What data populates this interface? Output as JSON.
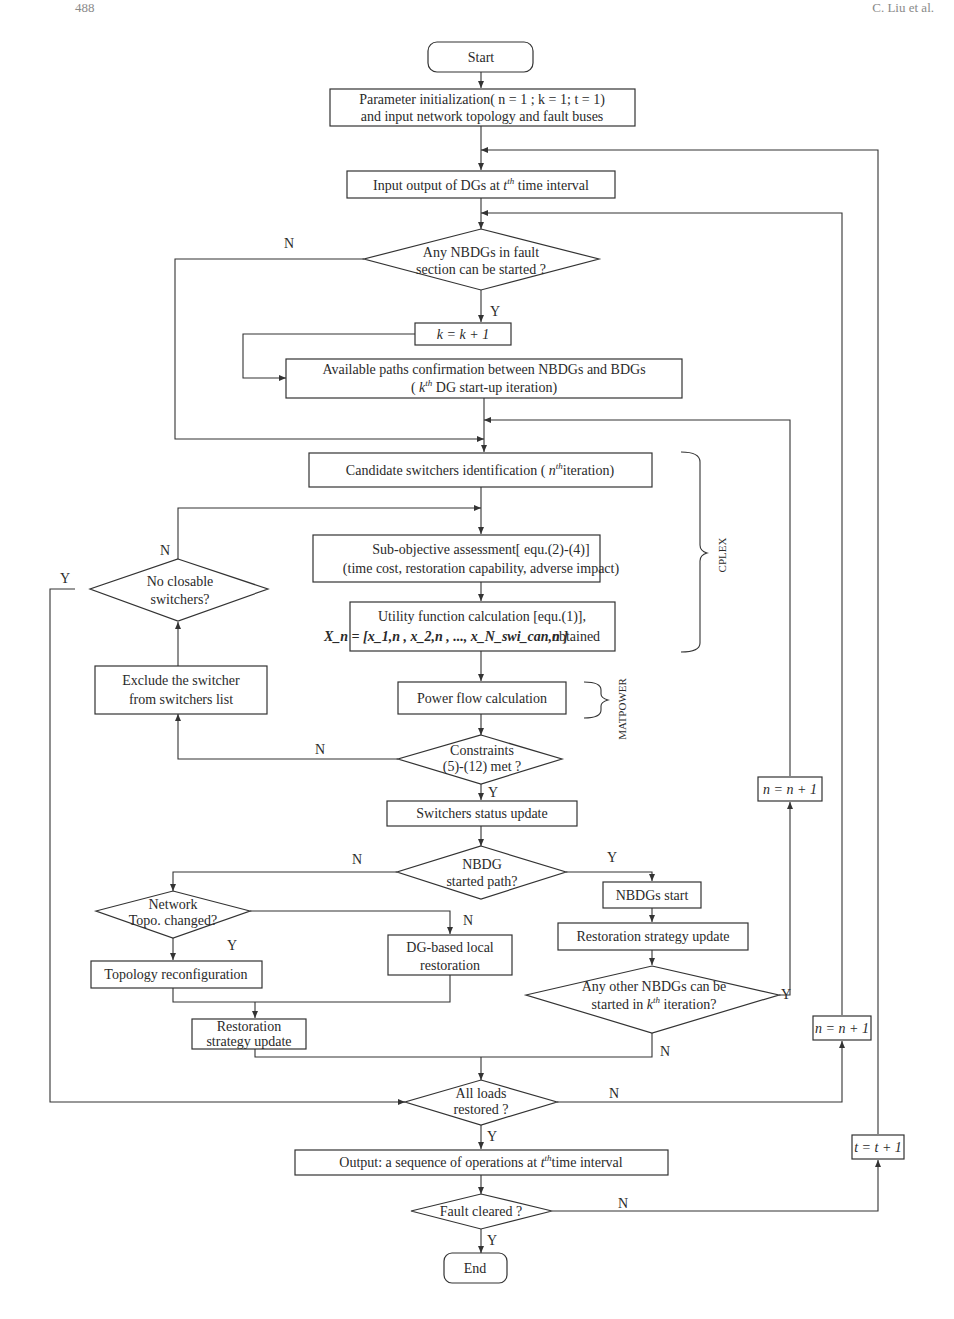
{
  "page": {
    "page_number": "488",
    "running_head": "C. Liu et al."
  },
  "nodes": {
    "start": "Start",
    "init_line1": "Parameter initialization( n = 1 ;  k = 1;  t = 1)",
    "init_line2": "and input network topology and  fault buses",
    "input_dg_pre": "Input output of DGs at ",
    "input_dg_var": "t",
    "input_dg_sup": "th",
    "input_dg_post": " time interval",
    "nbdg_fault_line1": "Any NBDGs in fault",
    "nbdg_fault_line2": "section can be started ?",
    "k_inc": "k = k + 1",
    "paths_line1": "Available paths confirmation  between NBDGs and BDGs",
    "paths_line2_pre": "( ",
    "paths_line2_var": "k",
    "paths_line2_sup": "th",
    "paths_line2_post": " DG start-up iteration)",
    "candidate_pre": "Candidate switchers identification  ( ",
    "candidate_var": "n",
    "candidate_sup": "th",
    "candidate_post": "iteration)",
    "subobj_line1": "Sub-objective assessment[ equ.(2)-(4)]",
    "subobj_line2": "(time cost, restoration capability, adverse impact)",
    "utility_line1": "Utility function calculation [equ.(1)],",
    "utility_line2_formula": "X_n = [x_1,n , x_2,n , ..., x_N_swi_can,n ]",
    "utility_line2_post": "obtained",
    "no_closable_line1": "No closable",
    "no_closable_line2": "switchers?",
    "exclude_line1": "Exclude the switcher",
    "exclude_line2": "from  switchers list",
    "power_flow": "Power flow calculation",
    "constraints_line1": "Constraints",
    "constraints_line2": "(5)-(12) met ?",
    "switch_status": "Switchers status update",
    "nbdg_path_line1": "NBDG",
    "nbdg_path_line2": "started path?",
    "network_line1": "Network",
    "network_line2": "Topo. changed?",
    "dg_local_line1": "DG-based local",
    "dg_local_line2": "restoration",
    "topo_reconf": "Topology reconfiguration",
    "restor_left_line1": "Restoration",
    "restor_left_line2": "strategy update",
    "nbdgs_start": "NBDGs  start",
    "restor_right": "Restoration strategy update",
    "other_nbdg_line1": "Any other NBDGs can be",
    "other_nbdg_line2_pre": "started in ",
    "other_nbdg_line2_var": "k",
    "other_nbdg_line2_sup": "th",
    "other_nbdg_line2_post": " iteration?",
    "n_inc_a": "n = n + 1",
    "n_inc_b": "n = n + 1",
    "all_loads_line1": "All loads",
    "all_loads_line2": "restored ?",
    "output_pre": "Output: a sequence of operations  at ",
    "output_var": "t",
    "output_sup": "th",
    "output_post": "time interval",
    "fault_cleared": "Fault cleared ?",
    "t_inc": "t = t + 1",
    "end": "End"
  },
  "brackets": {
    "cplex": "CPLEX",
    "matpower": "MATPOWER"
  },
  "branch_labels": {
    "yes": "Y",
    "no": "N"
  }
}
